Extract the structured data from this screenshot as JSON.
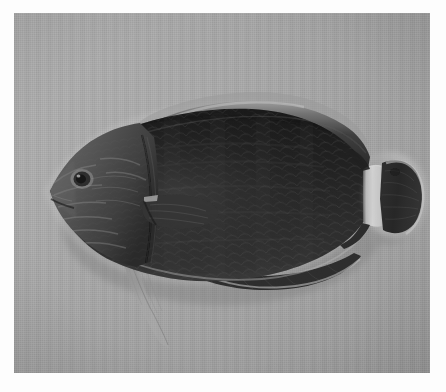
{
  "image": {
    "kind": "photograph",
    "subject": "fish-specimen",
    "common_description": "Lateral view of a dark-bodied reef fish specimen photographed on a plain gray cloth backdrop",
    "orientation": "left-facing",
    "color_mode": "grayscale",
    "canvas": {
      "width": 446,
      "height": 392
    },
    "plate": {
      "x": 14,
      "y": 13,
      "width": 416,
      "height": 360
    },
    "border_color": "#fdfdfd"
  },
  "palette": {
    "page_white": "#fdfdfd",
    "backdrop_gray": "#a9a9a9",
    "backdrop_light": "#b4b4b4",
    "backdrop_dark": "#9a9a9a",
    "body_black": "#1b1b1b",
    "body_dark": "#242424",
    "body_mid": "#343434",
    "head_gray": "#4c4c4c",
    "head_light": "#6a6a6a",
    "fin_translucent": "#b8b8b8",
    "peduncle_band": "#cfcfcf",
    "halo_light": "#c8c8c8"
  },
  "anatomy": {
    "parts": [
      {
        "name": "head",
        "label": "Head",
        "tone": "#4f4f4f"
      },
      {
        "name": "eye",
        "label": "Eye",
        "tone": "#2c2c2c"
      },
      {
        "name": "eye-ring",
        "label": "Eye ring",
        "tone": "#9a9a9a"
      },
      {
        "name": "snout",
        "label": "Snout",
        "tone": "#565656"
      },
      {
        "name": "opercle",
        "label": "Gill cover",
        "tone": "#3a3a3a"
      },
      {
        "name": "body",
        "label": "Body",
        "tone": "#1f1f1f"
      },
      {
        "name": "dorsal-fin",
        "label": "Dorsal fin",
        "tone": "#2a2a2a"
      },
      {
        "name": "pectoral-fin",
        "label": "Pectoral fin",
        "tone": "#2e2e2e"
      },
      {
        "name": "pelvic-fin",
        "label": "Pelvic fin",
        "tone": "#b0b0b0"
      },
      {
        "name": "anal-fin",
        "label": "Anal fin",
        "tone": "#242424"
      },
      {
        "name": "caudal-peduncle-band",
        "label": "Pale caudal peduncle band",
        "tone": "#d2d2d2"
      },
      {
        "name": "caudal-fin",
        "label": "Caudal fin",
        "tone": "#262626"
      }
    ],
    "markings": [
      "pale vertical band across the caudal peduncle",
      "light curved stripes radiating across the cheek and snout",
      "faint scale reticulation over the flank",
      "translucent whitish margin along the dorsal fin",
      "pale halo outlining the ventral and caudal margins"
    ]
  },
  "caption": {
    "visible": false,
    "text": ""
  }
}
